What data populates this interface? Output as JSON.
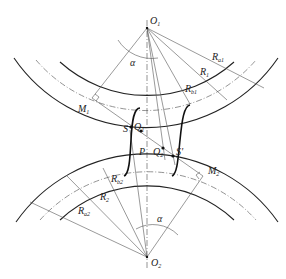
{
  "diagram": {
    "labels": {
      "o1": "O",
      "o1_sub": "1",
      "o2": "O",
      "o2_sub": "2",
      "alpha_top": "α",
      "alpha_bottom": "α",
      "ra1": "R",
      "ra1_sub": "a1",
      "r1": "R",
      "r1_sub": "1",
      "rb1": "R",
      "rb1_sub": "b1",
      "m1": "M",
      "m1_sub": "1",
      "s": "S",
      "q1": "Q",
      "q1_sub": "1",
      "p": "P",
      "q2": "Q",
      "q2_sub": "2",
      "s_prime": "S'",
      "m2": "M",
      "m2_sub": "2",
      "rb2": "R",
      "rb2_sub": "b2",
      "r2": "R",
      "r2_sub": "2",
      "ra2": "R",
      "ra2_sub": "a2"
    },
    "colors": {
      "line": "#222222",
      "thin": "#555555",
      "background": "#ffffff"
    }
  }
}
